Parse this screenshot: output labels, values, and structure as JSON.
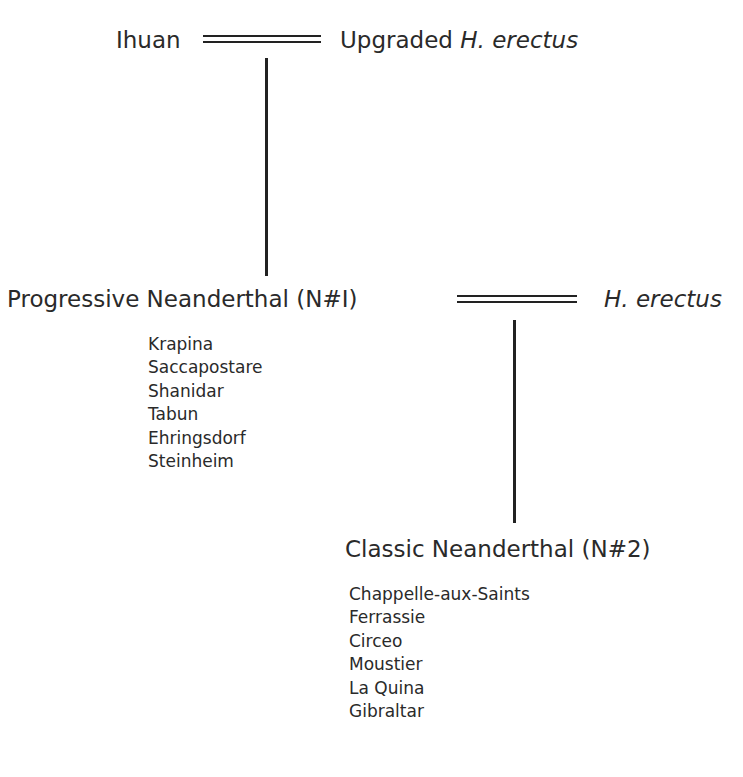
{
  "diagram": {
    "top_left_node": "Ihuan",
    "top_right_node": {
      "prefix": "Upgraded ",
      "italic": "H. erectus"
    },
    "mid_left_node": "Progressive Neanderthal (N#I)",
    "mid_right_node": {
      "italic": "H. erectus"
    },
    "bottom_node": "Classic Neanderthal (N#2)",
    "progressive_sites": [
      "Krapina",
      "Saccapostare",
      "Shanidar",
      "Tabun",
      "Ehringsdorf",
      "Steinheim"
    ],
    "classic_sites": [
      "Chappelle-aux-Saints",
      "Ferrassie",
      "Circeo",
      "Moustier",
      "La Quina",
      "Gibraltar"
    ],
    "edges": [
      {
        "type": "double",
        "from": "Ihuan",
        "to": "Upgraded H. erectus"
      },
      {
        "type": "single",
        "from": "Ihuan = Upgraded H. erectus",
        "to": "Progressive Neanderthal (N#I)"
      },
      {
        "type": "double",
        "from": "Progressive Neanderthal (N#I)",
        "to": "H. erectus"
      },
      {
        "type": "single",
        "from": "Progressive Neanderthal (N#I) = H. erectus",
        "to": "Classic Neanderthal (N#2)"
      }
    ]
  }
}
